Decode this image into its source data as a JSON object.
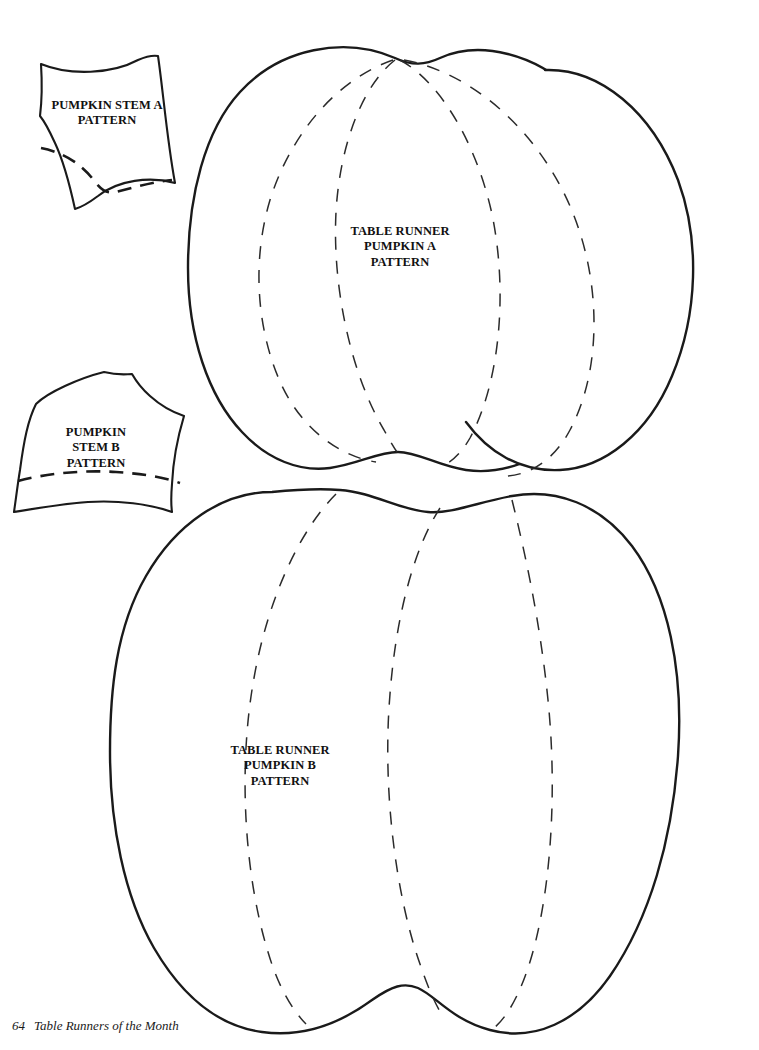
{
  "page": {
    "kind": "sewing-pattern-sheet",
    "background_color": "#ffffff",
    "ink_color": "#1a1a1a",
    "width": 759,
    "height": 1050
  },
  "footer": {
    "page_number": "64",
    "book_title": "Table Runners of the Month"
  },
  "pieces": [
    {
      "id": "stem-a",
      "label": "PUMPKIN STEM A\nPATTERN",
      "type": "stem",
      "has_dashed_seam": true
    },
    {
      "id": "pumpkin-a",
      "label": "TABLE RUNNER\nPUMPKIN A\nPATTERN",
      "type": "pumpkin-body",
      "rib_count": 4
    },
    {
      "id": "stem-b",
      "label": "PUMPKIN\nSTEM B\nPATTERN",
      "type": "stem",
      "has_dashed_seam": true
    },
    {
      "id": "pumpkin-b",
      "label": "TABLE RUNNER\nPUMPKIN B\nPATTERN",
      "type": "pumpkin-body",
      "rib_count": 3
    }
  ],
  "labels": {
    "stem_a": "PUMPKIN STEM A\nPATTERN",
    "stem_b": "PUMPKIN\nSTEM B\nPATTERN",
    "pumpkin_a": "TABLE RUNNER\nPUMPKIN A\nPATTERN",
    "pumpkin_b": "TABLE RUNNER\nPUMPKIN B\nPATTERN"
  }
}
